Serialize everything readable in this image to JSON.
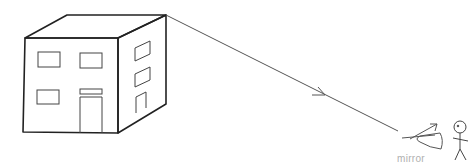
{
  "diagram": {
    "elements": [
      "building",
      "light-ray",
      "mirror",
      "observer-stick-figure"
    ],
    "labels": {
      "mirror": "mirror"
    },
    "colors": {
      "building_stroke": "#222222",
      "ray_stroke": "#555555",
      "label_text": "#b0b0b0"
    }
  }
}
